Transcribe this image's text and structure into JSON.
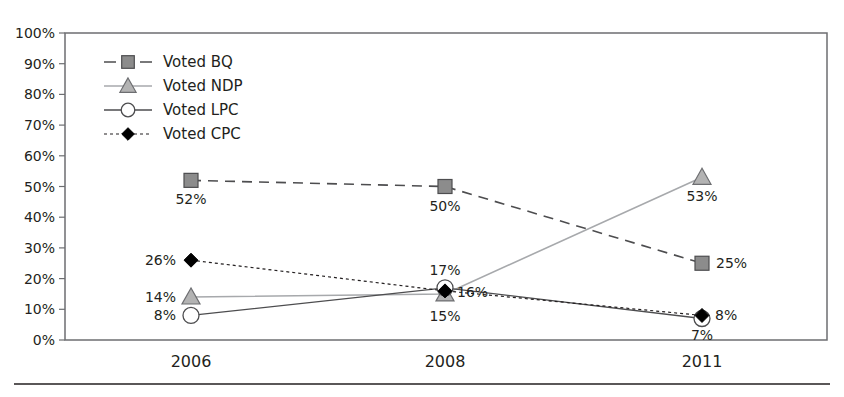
{
  "chart_data": {
    "type": "line",
    "title": "",
    "xlabel": "",
    "ylabel": "",
    "categories": [
      "2006",
      "2008",
      "2011"
    ],
    "ylim": [
      0,
      100
    ],
    "yticks": [
      "0%",
      "10%",
      "20%",
      "30%",
      "40%",
      "50%",
      "60%",
      "70%",
      "80%",
      "90%",
      "100%"
    ],
    "grid": false,
    "legend_position": "upper-left inside",
    "series": [
      {
        "name": "Voted BQ",
        "values": [
          52,
          50,
          25
        ],
        "labels": [
          "52%",
          "50%",
          "25%"
        ],
        "marker": "square",
        "line": "dashed",
        "color": "#8c8c8c"
      },
      {
        "name": "Voted NDP",
        "values": [
          14,
          15,
          53
        ],
        "labels": [
          "14%",
          "15%",
          "53%"
        ],
        "marker": "triangle",
        "line": "solid-light",
        "color": "#b3b3b3"
      },
      {
        "name": "Voted LPC",
        "values": [
          8,
          17,
          7
        ],
        "labels": [
          "8%",
          "17%",
          "7%"
        ],
        "marker": "circle",
        "line": "solid",
        "color": "#ffffff"
      },
      {
        "name": "Voted CPC",
        "values": [
          26,
          16,
          8
        ],
        "labels": [
          "26%",
          "16%",
          "8%"
        ],
        "marker": "diamond",
        "line": "dotted",
        "color": "#000000"
      }
    ]
  }
}
